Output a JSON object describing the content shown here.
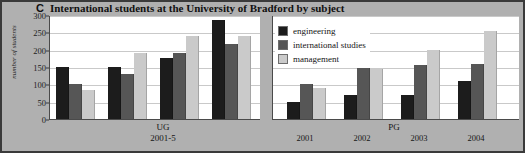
{
  "figure": {
    "panel_letter": "C",
    "title": "International students at the University of Bradford by subject"
  },
  "chart_data": {
    "type": "bar",
    "title": "International students at the University of Bradford by subject",
    "panel_letter": "C",
    "xlabel": "",
    "ylabel": "number of students",
    "ylim": [
      0,
      300
    ],
    "ytick_values": [
      0,
      50,
      100,
      150,
      200,
      250,
      300
    ],
    "ytick_labels": [
      "0",
      "50",
      "100",
      "150",
      "200",
      "250",
      "300"
    ],
    "grid": true,
    "legend_position": "top-right",
    "grouping": "grouped-bars",
    "panels": [
      {
        "name": "UG",
        "group_title": "UG",
        "group_subtitle": "2001-5",
        "categories": [
          "",
          "",
          "",
          ""
        ],
        "series": [
          {
            "name": "engineering",
            "color": "#1c1c1c",
            "values": [
              150,
              150,
              175,
              285
            ]
          },
          {
            "name": "international studies",
            "color": "#565656",
            "values": [
              100,
              130,
              190,
              215
            ]
          },
          {
            "name": "management",
            "color": "#cacaca",
            "values": [
              85,
              190,
              240,
              240
            ]
          }
        ]
      },
      {
        "name": "PG",
        "group_title": "PG",
        "categories": [
          "2001",
          "2002",
          "2003",
          "2004"
        ],
        "series": [
          {
            "name": "engineering",
            "color": "#1c1c1c",
            "values": [
              50,
              70,
              70,
              110
            ]
          },
          {
            "name": "international studies",
            "color": "#565656",
            "values": [
              100,
              150,
              155,
              160
            ]
          },
          {
            "name": "management",
            "color": "#cacaca",
            "values": [
              90,
              145,
              200,
              255
            ]
          }
        ]
      }
    ],
    "legend": [
      {
        "label": "engineering",
        "color": "#1c1c1c"
      },
      {
        "label": "international studies",
        "color": "#565656"
      },
      {
        "label": "management",
        "color": "#cacaca"
      }
    ]
  }
}
